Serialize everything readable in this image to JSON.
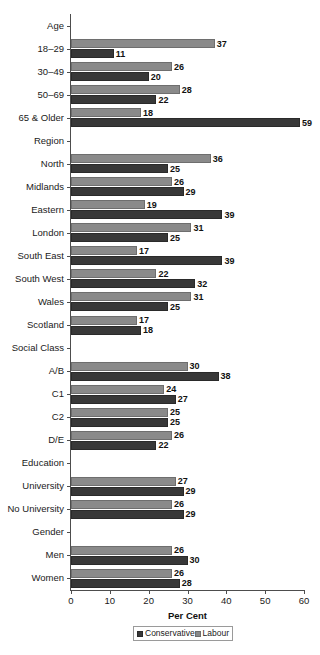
{
  "chart_data": {
    "type": "bar",
    "orientation": "horizontal",
    "title": "",
    "xlabel": "Per Cent",
    "ylabel": "",
    "xlim": [
      0,
      60
    ],
    "xticks": [
      0,
      10,
      20,
      30,
      40,
      50,
      60
    ],
    "grid": false,
    "legend_position": "bottom",
    "series": [
      {
        "name": "Conservative",
        "color": "#383838"
      },
      {
        "name": "Labour",
        "color": "#8a8a8a"
      }
    ],
    "rows": [
      {
        "label": "Age",
        "group_header": true
      },
      {
        "label": "18–29",
        "group_header": false,
        "labour": 37,
        "conservative": 11
      },
      {
        "label": "30–49",
        "group_header": false,
        "labour": 26,
        "conservative": 20
      },
      {
        "label": "50–69",
        "group_header": false,
        "labour": 28,
        "conservative": 22
      },
      {
        "label": "65 & Older",
        "group_header": false,
        "labour": 18,
        "conservative": 59
      },
      {
        "label": "Region",
        "group_header": true
      },
      {
        "label": "North",
        "group_header": false,
        "labour": 36,
        "conservative": 25
      },
      {
        "label": "Midlands",
        "group_header": false,
        "labour": 26,
        "conservative": 29
      },
      {
        "label": "Eastern",
        "group_header": false,
        "labour": 19,
        "conservative": 39
      },
      {
        "label": "London",
        "group_header": false,
        "labour": 31,
        "conservative": 25
      },
      {
        "label": "South East",
        "group_header": false,
        "labour": 17,
        "conservative": 39
      },
      {
        "label": "South West",
        "group_header": false,
        "labour": 22,
        "conservative": 32
      },
      {
        "label": "Wales",
        "group_header": false,
        "labour": 31,
        "conservative": 25
      },
      {
        "label": "Scotland",
        "group_header": false,
        "labour": 17,
        "conservative": 18
      },
      {
        "label": "Social Class",
        "group_header": true
      },
      {
        "label": "A/B",
        "group_header": false,
        "labour": 30,
        "conservative": 38
      },
      {
        "label": "C1",
        "group_header": false,
        "labour": 24,
        "conservative": 27
      },
      {
        "label": "C2",
        "group_header": false,
        "labour": 25,
        "conservative": 25
      },
      {
        "label": "D/E",
        "group_header": false,
        "labour": 26,
        "conservative": 22
      },
      {
        "label": "Education",
        "group_header": true
      },
      {
        "label": "University",
        "group_header": false,
        "labour": 27,
        "conservative": 29
      },
      {
        "label": "No University",
        "group_header": false,
        "labour": 26,
        "conservative": 29
      },
      {
        "label": "Gender",
        "group_header": true
      },
      {
        "label": "Men",
        "group_header": false,
        "labour": 26,
        "conservative": 30
      },
      {
        "label": "Women",
        "group_header": false,
        "labour": 26,
        "conservative": 28
      }
    ]
  }
}
